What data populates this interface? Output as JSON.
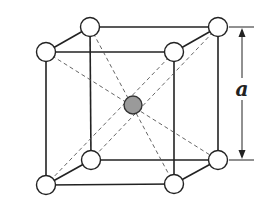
{
  "diagram": {
    "lattice_label": "a",
    "atom_radius": 9.5,
    "corner_atoms": [
      {
        "id": "back-top-left",
        "x": 90,
        "y": 27
      },
      {
        "id": "back-top-right",
        "x": 218,
        "y": 27
      },
      {
        "id": "front-top-left",
        "x": 46,
        "y": 52
      },
      {
        "id": "front-top-right",
        "x": 174,
        "y": 52
      },
      {
        "id": "back-bottom-left",
        "x": 91,
        "y": 160
      },
      {
        "id": "back-bottom-right",
        "x": 218,
        "y": 160
      },
      {
        "id": "front-bottom-left",
        "x": 46,
        "y": 185
      },
      {
        "id": "front-bottom-right",
        "x": 174,
        "y": 184
      }
    ],
    "center_atom": {
      "id": "body-center",
      "x": 133,
      "y": 105
    },
    "colors": {
      "center_fill": "#9a9a9a",
      "corner_fill": "#ffffff",
      "line": "#222222"
    }
  }
}
